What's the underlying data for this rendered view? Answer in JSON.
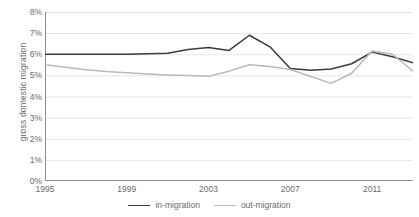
{
  "chart_data": {
    "type": "line",
    "title": "",
    "xlabel": "",
    "ylabel": "gross domestic migration",
    "x": [
      1995,
      1996,
      1997,
      1998,
      1999,
      2000,
      2001,
      2002,
      2003,
      2004,
      2005,
      2006,
      2007,
      2008,
      2009,
      2010,
      2011,
      2012,
      2013
    ],
    "xlim": [
      1995,
      2013
    ],
    "ylim": [
      0,
      8
    ],
    "ytick_labels": [
      "0%",
      "1%",
      "2%",
      "3%",
      "4%",
      "5%",
      "6%",
      "7%",
      "8%"
    ],
    "ytick_values": [
      0,
      1,
      2,
      3,
      4,
      5,
      6,
      7,
      8
    ],
    "xtick_labels": [
      "1995",
      "1999",
      "2003",
      "2007",
      "2011"
    ],
    "xtick_values": [
      1995,
      1999,
      2003,
      2007,
      2011
    ],
    "xtick_minor_interval": 1,
    "grid": "horizontal",
    "legend_position": "bottom-center",
    "series": [
      {
        "name": "in-migration",
        "color": "#3b3b3d",
        "values": [
          6.0,
          6.0,
          6.0,
          6.0,
          6.0,
          6.02,
          6.05,
          6.22,
          6.32,
          6.18,
          6.9,
          6.35,
          5.32,
          5.24,
          5.3,
          5.55,
          6.1,
          5.88,
          5.6
        ]
      },
      {
        "name": "out-migration",
        "color": "#b9b9bb",
        "values": [
          5.5,
          5.38,
          5.27,
          5.18,
          5.12,
          5.06,
          5.02,
          5.0,
          4.96,
          5.2,
          5.5,
          5.42,
          5.28,
          4.95,
          4.62,
          5.1,
          6.15,
          6.0,
          5.2
        ]
      }
    ]
  },
  "legend": {
    "items": [
      {
        "label": "in-migration",
        "color": "#3b3b3d"
      },
      {
        "label": "out-migration",
        "color": "#b9b9bb"
      }
    ]
  },
  "axis": {
    "axis_color": "#8d8d8f",
    "grid_color": "#e6e6e6",
    "tick_color": "#8d8d8f"
  }
}
